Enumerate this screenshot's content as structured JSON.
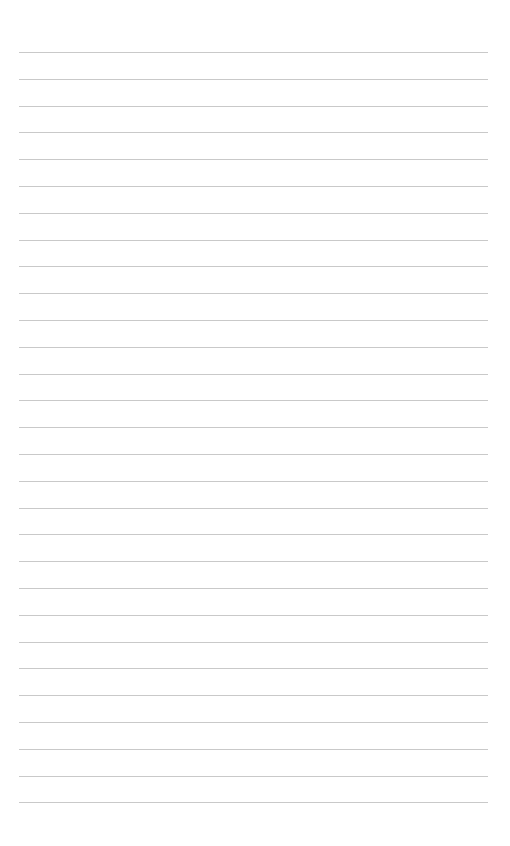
{
  "page": {
    "type": "blank ruled sheet",
    "background_color": "#ffffff",
    "rule_color": "#c9c9c9",
    "rule_count": 29,
    "first_rule_y": 52,
    "rule_spacing": 26.8,
    "rule_left": 19,
    "rule_right": 488
  }
}
